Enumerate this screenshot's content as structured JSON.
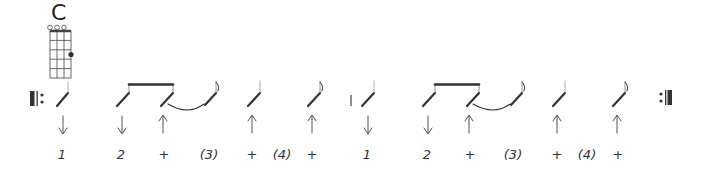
{
  "chord": {
    "name": "C",
    "strings": 4,
    "frets": 5,
    "open_strings": [
      1,
      2,
      3
    ],
    "fingering": [
      {
        "string": 4,
        "fret": 3
      }
    ]
  },
  "repeat": {
    "start": "||:",
    "end": ":||"
  },
  "colors": {
    "ink": "#333333",
    "light": "#777777"
  },
  "measures": [
    {
      "counts": [
        "1",
        "2",
        "+",
        "(3)",
        "+",
        "(4)",
        "+"
      ],
      "strums": [
        "down",
        "down",
        "up",
        "",
        "up",
        "",
        "up"
      ]
    },
    {
      "counts": [
        "1",
        "2",
        "+",
        "(3)",
        "+",
        "(4)",
        "+"
      ],
      "strums": [
        "down",
        "down",
        "up",
        "",
        "up",
        "",
        "up"
      ]
    }
  ],
  "counts_flat": [
    "1",
    "2",
    "+",
    "(3)",
    "+",
    "(4)",
    "+",
    "1",
    "2",
    "+",
    "(3)",
    "+",
    "(4)",
    "+"
  ]
}
